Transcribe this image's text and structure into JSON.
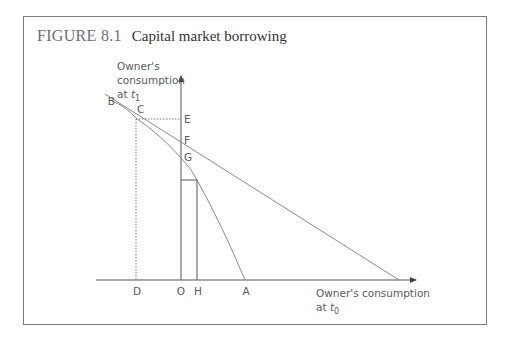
{
  "figure": {
    "number": "FIGURE 8.1",
    "caption": "Capital market borrowing"
  },
  "axes": {
    "y_label": {
      "line1": "Owner's",
      "line2": "consumption",
      "line3_prefix": "at ",
      "line3_var": "t",
      "line3_sub": "1"
    },
    "x_label": {
      "line1": "Owner's consumption",
      "line2_prefix": "at ",
      "line2_var": "t",
      "line2_sub": "0"
    }
  },
  "points": {
    "A": "A",
    "B": "B",
    "C": "C",
    "D": "D",
    "E": "E",
    "F": "F",
    "G": "G",
    "H": "H",
    "O": "O"
  },
  "colors": {
    "line": "#8a8a8a",
    "axis": "#555555",
    "frame": "#7a7a7a",
    "title_number": "#6e6e6e",
    "title_caption": "#333333"
  }
}
